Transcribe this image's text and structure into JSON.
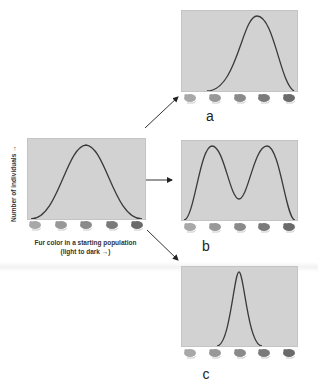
{
  "diagram": {
    "start_panel": {
      "ylabel": "Number of individuals",
      "xlabel_line1": "Fur color in a starting population",
      "xlabel_line2": "(light to dark →)",
      "distribution": "normal-centered"
    },
    "panels": [
      {
        "id": "a",
        "label": "a",
        "distribution": "shifted-right (directional selection)"
      },
      {
        "id": "b",
        "label": "b",
        "distribution": "bimodal (disruptive selection)"
      },
      {
        "id": "c",
        "label": "c",
        "distribution": "narrow-centered (stabilizing selection)"
      }
    ],
    "mouse_shades": [
      "#a8a8a8",
      "#989898",
      "#8a8a8a",
      "#7a7a7a",
      "#6a6a6a"
    ],
    "colors": {
      "plot_bg": "#d2d2d2",
      "curve": "#3a3a3a",
      "arrow": "#222222"
    }
  }
}
